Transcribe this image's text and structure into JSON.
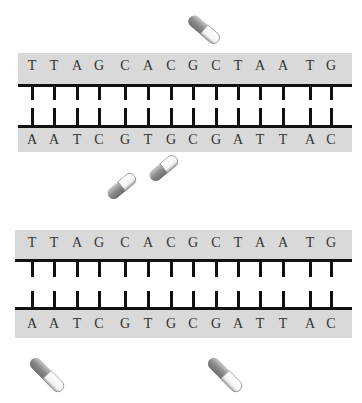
{
  "diagram": {
    "colors": {
      "band": "#d9d9d9",
      "line": "#111111",
      "text": "#333333",
      "pill_dark": "#8a8a8a",
      "pill_light": "#f4f4f4"
    },
    "strands": [
      {
        "top_sequence": [
          "T",
          "T",
          "A",
          "G",
          "C",
          "A",
          "C",
          "G",
          "C",
          "T",
          "A",
          "A",
          "T",
          "G"
        ],
        "bottom_sequence": [
          "A",
          "A",
          "T",
          "C",
          "G",
          "T",
          "G",
          "C",
          "G",
          "A",
          "T",
          "T",
          "A",
          "C"
        ]
      },
      {
        "top_sequence": [
          "T",
          "T",
          "A",
          "G",
          "C",
          "A",
          "C",
          "G",
          "C",
          "T",
          "A",
          "A",
          "T",
          "G"
        ],
        "bottom_sequence": [
          "A",
          "A",
          "T",
          "C",
          "G",
          "T",
          "G",
          "C",
          "G",
          "A",
          "T",
          "T",
          "A",
          "C"
        ]
      }
    ],
    "pills": [
      {
        "name": "pill-top",
        "x": 190,
        "y": 10,
        "angle": 40,
        "length": 38,
        "opened": true
      },
      {
        "name": "pill-middle-left",
        "x": 108,
        "y": 190,
        "angle": -40,
        "length": 34
      },
      {
        "name": "pill-middle-right",
        "x": 150,
        "y": 172,
        "angle": -40,
        "length": 34
      },
      {
        "name": "pill-bottom-left",
        "x": 32,
        "y": 352,
        "angle": 45,
        "length": 44
      },
      {
        "name": "pill-bottom-right",
        "x": 210,
        "y": 352,
        "angle": 45,
        "length": 44
      }
    ]
  }
}
